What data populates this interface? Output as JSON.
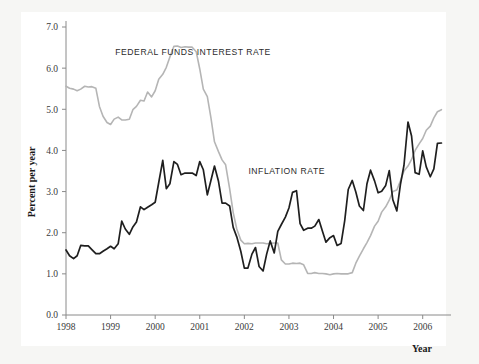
{
  "figure": {
    "background_color": "#f6f6f4",
    "panel_color": "#ffffff"
  },
  "chart_data": {
    "type": "line",
    "title": "",
    "subtitle": "",
    "xlabel": "Year",
    "ylabel": "Percent per year",
    "xlim": [
      1998,
      2006.5
    ],
    "ylim": [
      0.0,
      7.0
    ],
    "grid": false,
    "legend_position": "inline-annotations",
    "x_tick_labels": [
      "1998",
      "1999",
      "2000",
      "2001",
      "2002",
      "2003",
      "2004",
      "2005",
      "2006"
    ],
    "x_tick_values": [
      1998,
      1999,
      2000,
      2001,
      2002,
      2003,
      2004,
      2005,
      2006
    ],
    "y_tick_labels": [
      "0.0",
      "1.0",
      "2.0",
      "3.0",
      "4.0",
      "5.0",
      "6.0",
      "7.0"
    ],
    "y_tick_values": [
      0.0,
      1.0,
      2.0,
      3.0,
      4.0,
      5.0,
      6.0,
      7.0
    ],
    "annotations": [
      {
        "text": "FEDERAL FUNDS INTEREST RATE",
        "x": 2000.85,
        "y": 6.33
      },
      {
        "text": "INFLATION RATE",
        "x": 2002.95,
        "y": 3.42
      }
    ],
    "series": [
      {
        "name": "FEDERAL FUNDS INTEREST RATE",
        "color": "#b5b5b5",
        "line_width": 1.6,
        "x": [
          1998.0,
          1998.08,
          1998.17,
          1998.25,
          1998.33,
          1998.42,
          1998.5,
          1998.58,
          1998.67,
          1998.75,
          1998.83,
          1998.92,
          1999.0,
          1999.08,
          1999.17,
          1999.25,
          1999.33,
          1999.42,
          1999.5,
          1999.58,
          1999.67,
          1999.75,
          1999.83,
          1999.92,
          2000.0,
          2000.08,
          2000.17,
          2000.25,
          2000.33,
          2000.42,
          2000.5,
          2000.58,
          2000.67,
          2000.75,
          2000.83,
          2000.92,
          2001.0,
          2001.08,
          2001.17,
          2001.25,
          2001.33,
          2001.42,
          2001.5,
          2001.58,
          2001.67,
          2001.75,
          2001.83,
          2001.92,
          2002.0,
          2002.08,
          2002.17,
          2002.25,
          2002.33,
          2002.42,
          2002.5,
          2002.58,
          2002.67,
          2002.75,
          2002.83,
          2002.92,
          2003.0,
          2003.08,
          2003.17,
          2003.25,
          2003.33,
          2003.42,
          2003.5,
          2003.58,
          2003.67,
          2003.75,
          2003.83,
          2003.92,
          2004.0,
          2004.08,
          2004.17,
          2004.25,
          2004.33,
          2004.42,
          2004.5,
          2004.58,
          2004.67,
          2004.75,
          2004.83,
          2004.92,
          2005.0,
          2005.08,
          2005.17,
          2005.25,
          2005.33,
          2005.42,
          2005.5,
          2005.58,
          2005.67,
          2005.75,
          2005.83,
          2005.92,
          2006.0,
          2006.08,
          2006.17,
          2006.25,
          2006.33,
          2006.42
        ],
        "y": [
          5.56,
          5.51,
          5.49,
          5.45,
          5.49,
          5.56,
          5.54,
          5.55,
          5.51,
          5.07,
          4.83,
          4.68,
          4.63,
          4.76,
          4.81,
          4.74,
          4.74,
          4.76,
          4.99,
          5.07,
          5.22,
          5.2,
          5.42,
          5.3,
          5.45,
          5.73,
          5.85,
          6.02,
          6.27,
          6.53,
          6.54,
          6.5,
          6.52,
          6.51,
          6.51,
          6.4,
          5.98,
          5.49,
          5.31,
          4.8,
          4.21,
          3.97,
          3.77,
          3.65,
          3.07,
          2.49,
          2.09,
          1.82,
          1.73,
          1.74,
          1.73,
          1.75,
          1.75,
          1.75,
          1.73,
          1.74,
          1.75,
          1.75,
          1.34,
          1.24,
          1.24,
          1.26,
          1.25,
          1.26,
          1.22,
          1.01,
          1.01,
          1.03,
          1.01,
          1.01,
          1.0,
          0.98,
          1.0,
          1.01,
          1.0,
          1.0,
          1.0,
          1.03,
          1.26,
          1.43,
          1.61,
          1.76,
          1.93,
          2.16,
          2.28,
          2.5,
          2.63,
          2.79,
          3.0,
          3.04,
          3.26,
          3.5,
          3.62,
          3.78,
          4.0,
          4.16,
          4.29,
          4.49,
          4.59,
          4.79,
          4.94,
          4.99
        ],
        "data_points": 102
      },
      {
        "name": "INFLATION RATE",
        "color": "#1f1f1f",
        "line_width": 1.7,
        "x": [
          1998.0,
          1998.08,
          1998.17,
          1998.25,
          1998.33,
          1998.42,
          1998.5,
          1998.58,
          1998.67,
          1998.75,
          1998.83,
          1998.92,
          1999.0,
          1999.08,
          1999.17,
          1999.25,
          1999.33,
          1999.42,
          1999.5,
          1999.58,
          1999.67,
          1999.75,
          1999.83,
          1999.92,
          2000.0,
          2000.08,
          2000.17,
          2000.25,
          2000.33,
          2000.42,
          2000.5,
          2000.58,
          2000.67,
          2000.75,
          2000.83,
          2000.92,
          2001.0,
          2001.08,
          2001.17,
          2001.25,
          2001.33,
          2001.42,
          2001.5,
          2001.58,
          2001.67,
          2001.75,
          2001.83,
          2001.92,
          2002.0,
          2002.08,
          2002.17,
          2002.25,
          2002.33,
          2002.42,
          2002.5,
          2002.58,
          2002.67,
          2002.75,
          2002.83,
          2002.92,
          2003.0,
          2003.08,
          2003.17,
          2003.25,
          2003.33,
          2003.42,
          2003.5,
          2003.58,
          2003.67,
          2003.75,
          2003.83,
          2003.92,
          2004.0,
          2004.08,
          2004.17,
          2004.25,
          2004.33,
          2004.42,
          2004.5,
          2004.58,
          2004.67,
          2004.75,
          2004.83,
          2004.92,
          2005.0,
          2005.08,
          2005.17,
          2005.25,
          2005.33,
          2005.42,
          2005.5,
          2005.58,
          2005.67,
          2005.75,
          2005.83,
          2005.92,
          2006.0,
          2006.08,
          2006.17,
          2006.25,
          2006.33,
          2006.42
        ],
        "y": [
          1.58,
          1.44,
          1.37,
          1.44,
          1.69,
          1.68,
          1.68,
          1.59,
          1.49,
          1.49,
          1.55,
          1.61,
          1.67,
          1.61,
          1.73,
          2.28,
          2.09,
          1.96,
          2.14,
          2.26,
          2.63,
          2.56,
          2.62,
          2.68,
          2.74,
          3.22,
          3.76,
          3.07,
          3.19,
          3.73,
          3.66,
          3.41,
          3.45,
          3.45,
          3.45,
          3.39,
          3.73,
          3.53,
          2.92,
          3.27,
          3.62,
          3.25,
          2.72,
          2.72,
          2.65,
          2.13,
          1.9,
          1.55,
          1.14,
          1.14,
          1.48,
          1.64,
          1.18,
          1.07,
          1.48,
          1.8,
          1.51,
          2.03,
          2.2,
          2.38,
          2.6,
          2.98,
          3.02,
          2.22,
          2.06,
          2.11,
          2.11,
          2.16,
          2.32,
          2.04,
          1.77,
          1.88,
          1.93,
          1.69,
          1.74,
          2.29,
          3.05,
          3.27,
          2.99,
          2.65,
          2.54,
          3.19,
          3.52,
          3.26,
          2.97,
          3.01,
          3.15,
          3.51,
          2.8,
          2.53,
          3.17,
          3.64,
          4.69,
          4.35,
          3.46,
          3.42,
          3.99,
          3.6,
          3.36,
          3.55,
          4.17,
          4.18
        ],
        "data_points": 102
      }
    ]
  }
}
